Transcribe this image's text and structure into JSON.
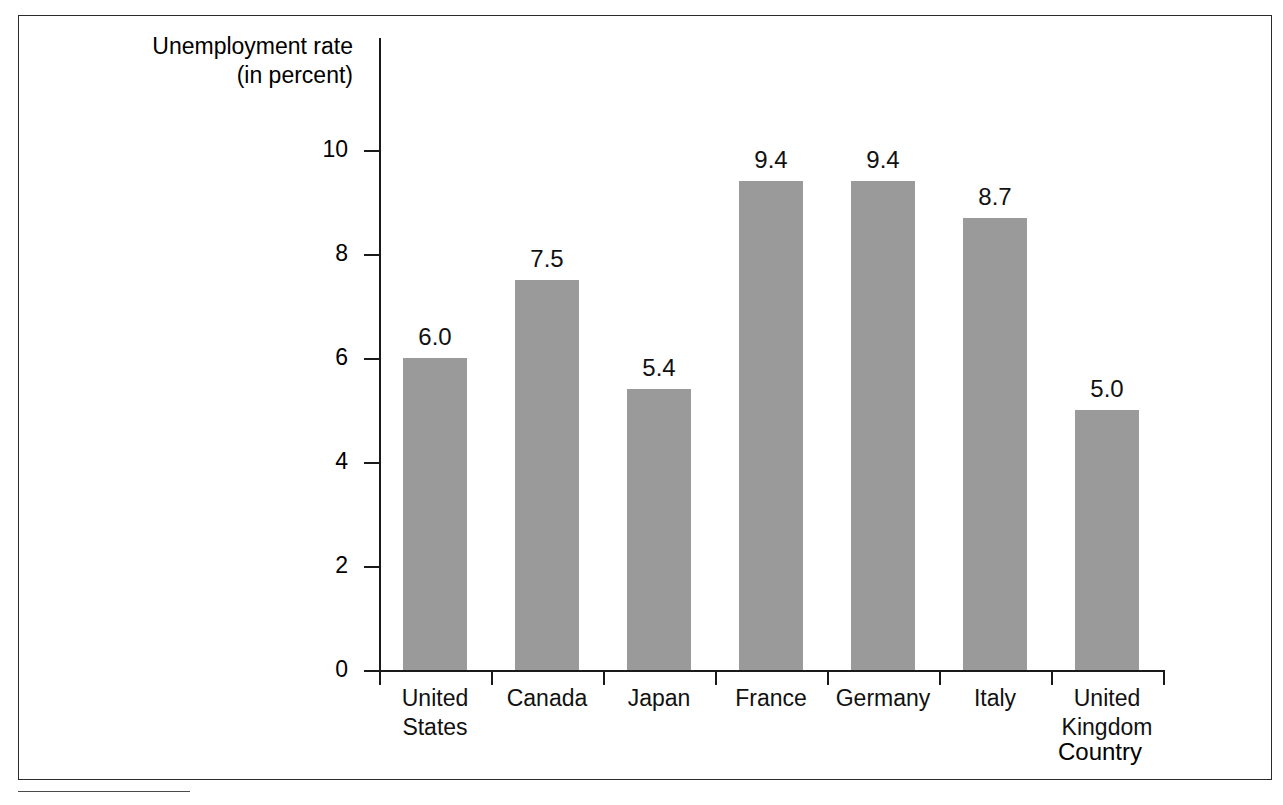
{
  "figure": {
    "frame_visible": true,
    "footnote_rule_visible": true
  },
  "chart_data": {
    "type": "bar",
    "title": "",
    "xlabel": "Country",
    "ylabel": "Unemployment rate\n(in percent)",
    "categories": [
      "United\nStates",
      "Canada",
      "Japan",
      "France",
      "Germany",
      "Italy",
      "United\nKingdom"
    ],
    "values": [
      6.0,
      7.5,
      5.4,
      9.4,
      9.4,
      8.7,
      5.0
    ],
    "value_labels": [
      "6.0",
      "7.5",
      "5.4",
      "9.4",
      "9.4",
      "8.7",
      "5.0"
    ],
    "ylim": [
      0,
      12.2
    ],
    "yticks": [
      0,
      2,
      4,
      6,
      8,
      10
    ],
    "ytick_labels": [
      "0",
      "2",
      "4",
      "6",
      "8",
      "10"
    ],
    "grid": false,
    "legend": null,
    "bar_color": "#9a9a9a",
    "axis_color": "#1a1a1a"
  }
}
